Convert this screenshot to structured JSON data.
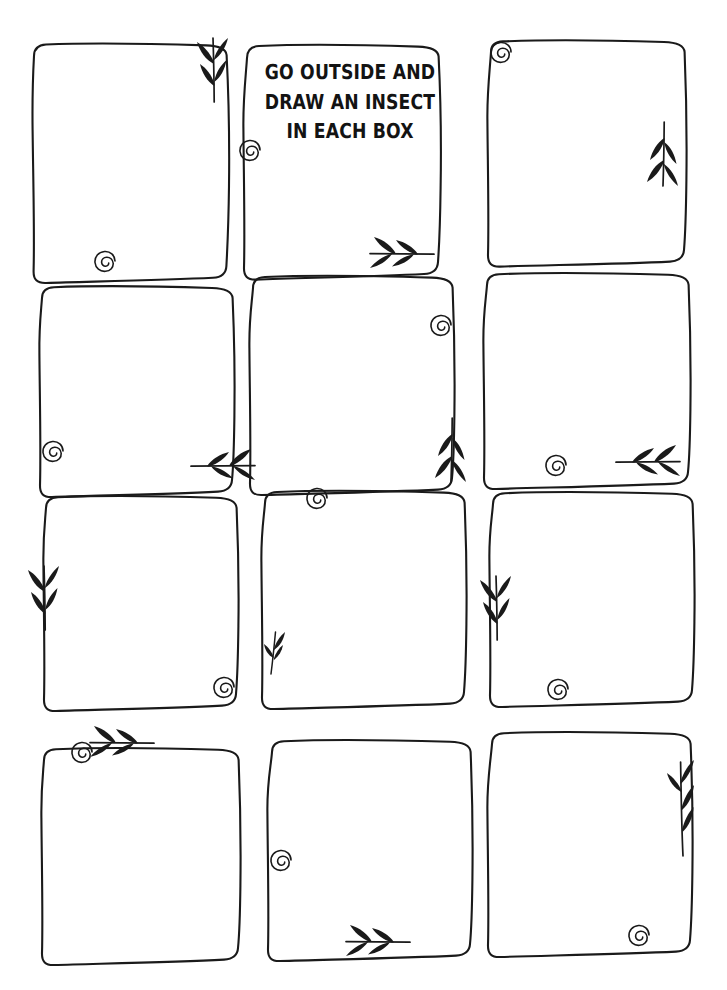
{
  "page": {
    "kind": "printable-worksheet",
    "background_color": "#ffffff",
    "ink_color": "#1a1a1a",
    "width": 727,
    "height": 990
  },
  "title": {
    "full_text": "GO OUTSIDE AND DRAW AN INSECT IN EACH BOX",
    "lines": [
      "GO OUTSIDE AND",
      "DRAW AN INSECT",
      "IN EACH BOX"
    ],
    "located_in_box": 2,
    "align": "center",
    "color": "#131313"
  },
  "grid": {
    "columns": 3,
    "rows": 4,
    "total_boxes": 12,
    "style": "hand-drawn wobbly rectangles"
  },
  "boxes": [
    {
      "index": 1,
      "row": 1,
      "column": 1,
      "label": "drawing-box-1",
      "content": "",
      "ornaments": [
        "leaf-arrow-down",
        "spiral-curl"
      ]
    },
    {
      "index": 2,
      "row": 1,
      "column": 2,
      "label": "drawing-box-2",
      "content": "GO OUTSIDE AND DRAW AN INSECT IN EACH BOX",
      "ornaments": [
        "spiral-curl",
        "leaf-arrow-right"
      ]
    },
    {
      "index": 3,
      "row": 1,
      "column": 3,
      "label": "drawing-box-3",
      "content": "",
      "ornaments": [
        "spiral-curl",
        "leaf-arrow-up"
      ]
    },
    {
      "index": 4,
      "row": 2,
      "column": 1,
      "label": "drawing-box-4",
      "content": "",
      "ornaments": [
        "spiral-curl",
        "leaf-arrow-left"
      ]
    },
    {
      "index": 5,
      "row": 2,
      "column": 2,
      "label": "drawing-box-5",
      "content": "",
      "ornaments": [
        "spiral-curl",
        "leaf-arrow-up"
      ]
    },
    {
      "index": 6,
      "row": 2,
      "column": 3,
      "label": "drawing-box-6",
      "content": "",
      "ornaments": [
        "spiral-curl",
        "leaf-arrow-left"
      ]
    },
    {
      "index": 7,
      "row": 3,
      "column": 1,
      "label": "drawing-box-7",
      "content": "",
      "ornaments": [
        "leaf-arrow-down",
        "spiral-curl"
      ]
    },
    {
      "index": 8,
      "row": 3,
      "column": 2,
      "label": "drawing-box-8",
      "content": "",
      "ornaments": [
        "spiral-curl",
        "leaf-sprig-small"
      ]
    },
    {
      "index": 9,
      "row": 3,
      "column": 3,
      "label": "drawing-box-9",
      "content": "",
      "ornaments": [
        "leaf-arrow-down",
        "spiral-curl"
      ]
    },
    {
      "index": 10,
      "row": 4,
      "column": 1,
      "label": "drawing-box-10",
      "content": "",
      "ornaments": [
        "spiral-curl",
        "leaf-arrow-right"
      ]
    },
    {
      "index": 11,
      "row": 4,
      "column": 2,
      "label": "drawing-box-11",
      "content": "",
      "ornaments": [
        "spiral-curl",
        "leaf-arrow-right"
      ]
    },
    {
      "index": 12,
      "row": 4,
      "column": 3,
      "label": "drawing-box-12",
      "content": "",
      "ornaments": [
        "leaf-sprig-up",
        "spiral-curl"
      ]
    }
  ],
  "ornament_names": {
    "leaf-arrow-down": "leaf-arrow-down-icon",
    "leaf-arrow-up": "leaf-arrow-up-icon",
    "leaf-arrow-left": "leaf-arrow-left-icon",
    "leaf-arrow-right": "leaf-arrow-right-icon",
    "leaf-sprig-up": "leaf-sprig-up-icon",
    "leaf-sprig-small": "leaf-sprig-small-icon",
    "spiral-curl": "spiral-curl-icon"
  }
}
